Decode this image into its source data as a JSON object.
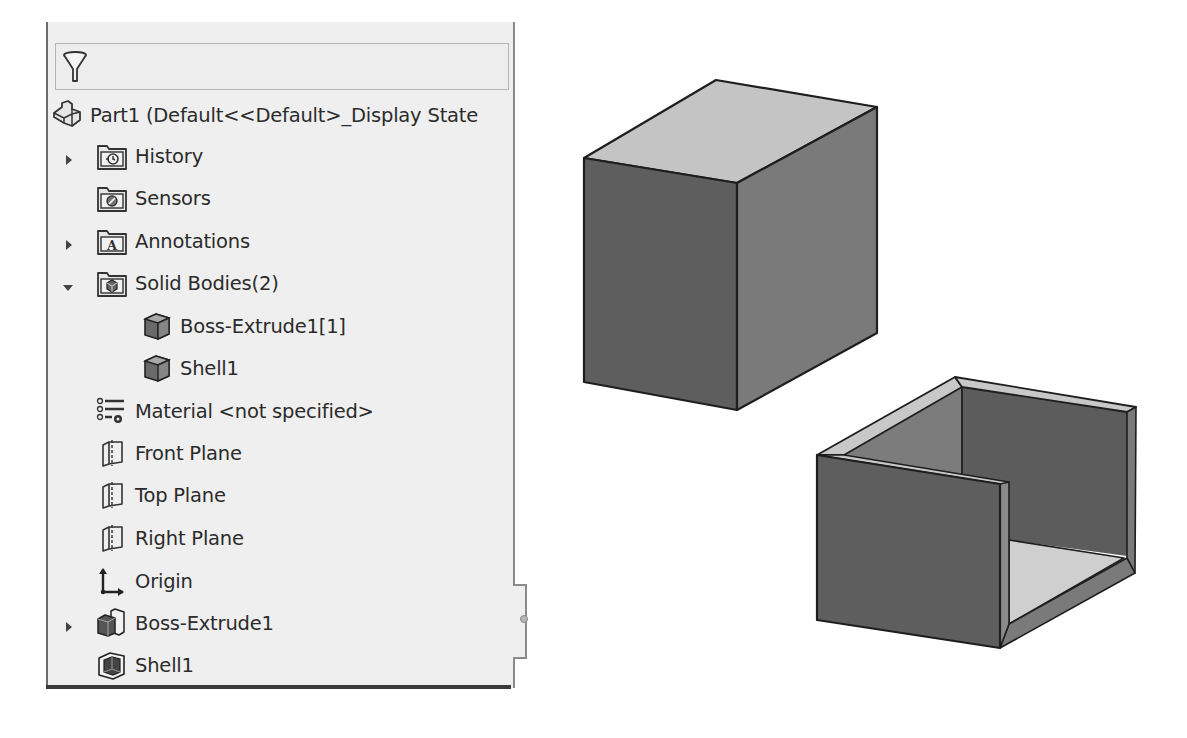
{
  "feature_tree": {
    "filter": {
      "icon": "filter-funnel-icon"
    },
    "root": {
      "label": "Part1  (Default<<Default>_Display State",
      "icon": "part-icon"
    },
    "items": [
      {
        "label": "History",
        "icon": "history-folder-icon",
        "expander": "collapsed",
        "indent": 1
      },
      {
        "label": "Sensors",
        "icon": "sensors-folder-icon",
        "expander": "none",
        "indent": 1
      },
      {
        "label": "Annotations",
        "icon": "annotations-folder-icon",
        "expander": "collapsed",
        "indent": 1
      },
      {
        "label": "Solid Bodies(2)",
        "icon": "solid-bodies-folder-icon",
        "expander": "expanded",
        "indent": 1
      },
      {
        "label": "Boss-Extrude1[1]",
        "icon": "solid-body-icon",
        "expander": "none",
        "indent": 2
      },
      {
        "label": "Shell1",
        "icon": "solid-body-icon",
        "expander": "none",
        "indent": 2
      },
      {
        "label": "Material <not specified>",
        "icon": "material-icon",
        "expander": "none",
        "indent": 1
      },
      {
        "label": "Front Plane",
        "icon": "plane-icon",
        "expander": "none",
        "indent": 1
      },
      {
        "label": "Top Plane",
        "icon": "plane-icon",
        "expander": "none",
        "indent": 1
      },
      {
        "label": "Right Plane",
        "icon": "plane-icon",
        "expander": "none",
        "indent": 1
      },
      {
        "label": "Origin",
        "icon": "origin-icon",
        "expander": "none",
        "indent": 1
      },
      {
        "label": "Boss-Extrude1",
        "icon": "extrude-feature-icon",
        "expander": "collapsed",
        "indent": 1
      },
      {
        "label": "Shell1",
        "icon": "shell-feature-icon",
        "expander": "none",
        "indent": 1
      }
    ]
  },
  "viewport": {
    "bodies": [
      {
        "name": "Boss-Extrude1[1]",
        "shape": "solid-block"
      },
      {
        "name": "Shell1",
        "shape": "open-shell-box"
      }
    ],
    "colors": {
      "top_face": "#c4c4c4",
      "left_face": "#5e5e5e",
      "right_face": "#7a7a7a",
      "inner_floor": "#cfcfcf",
      "edge": "#1e1e1e"
    }
  }
}
